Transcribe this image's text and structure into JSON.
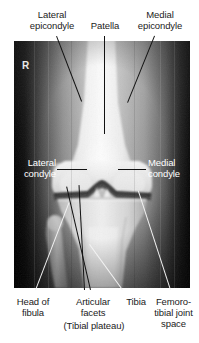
{
  "figure": {
    "modality": "X-ray",
    "laterality_marker": "R",
    "background_color": "#ffffff",
    "film_color": "#0a0a0a"
  },
  "labels": {
    "lateral_epicondyle": "Lateral\nepicondyle",
    "patella": "Patella",
    "medial_epicondyle": "Medial\nepicondyle",
    "lateral_condyle": "Lateral\ncondyle",
    "medial_condyle": "Medial\ncondyle",
    "head_of_fibula": "Head of\nfibula",
    "articular_facets": "Articular\nfacets",
    "tibial_plateau": "(Tibial plateau)",
    "tibia": "Tibia",
    "femorotibial_joint_space": "Femoro-\ntibial joint\nspace"
  }
}
